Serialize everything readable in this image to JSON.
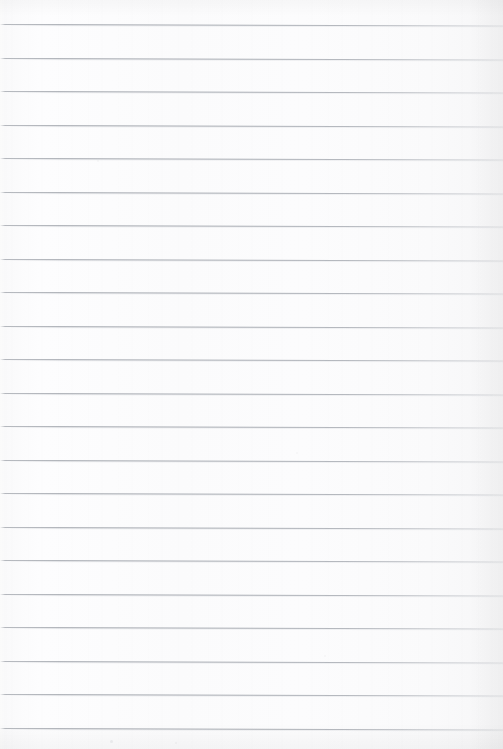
{
  "page": {
    "kind": "scanned-ruled-notebook-page",
    "width_px": 503,
    "height_px": 749,
    "content_text": "",
    "has_handwriting": false,
    "has_printed_text": false,
    "has_margin_line": false,
    "background_color": "#fcfcfd",
    "paper_tone_left": "#ffffff",
    "paper_tone_right": "#f6f6f7"
  },
  "ruling": {
    "line_color": "#787e88",
    "line_count": 22,
    "line_spacing_px": 33.5,
    "first_line_y_px": 24,
    "last_line_y_px": 727,
    "line_thickness_px": 1,
    "line_slant_deg": 0.18,
    "lines_y": [
      24,
      57.5,
      91,
      124.5,
      158,
      191.5,
      225,
      258.5,
      292,
      325.5,
      359,
      392.5,
      426,
      459.5,
      493,
      526.5,
      560,
      593.5,
      627,
      660.5,
      694,
      727.5
    ]
  },
  "artifacts": {
    "specks": [
      {
        "x_px": 110,
        "y_px": 740,
        "size_px": 3,
        "opacity": 0.1
      },
      {
        "x_px": 175,
        "y_px": 742,
        "size_px": 2,
        "opacity": 0.07
      },
      {
        "x_px": 296,
        "y_px": 452,
        "size_px": 2,
        "opacity": 0.05
      },
      {
        "x_px": 97,
        "y_px": 160,
        "size_px": 2,
        "opacity": 0.05
      },
      {
        "x_px": 324,
        "y_px": 655,
        "size_px": 2,
        "opacity": 0.05
      }
    ]
  }
}
